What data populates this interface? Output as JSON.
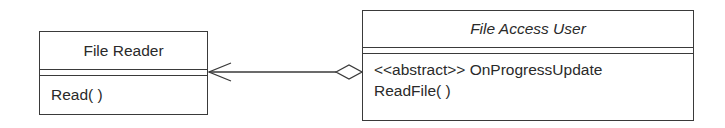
{
  "diagram_type": "UML class diagram",
  "classes": [
    {
      "id": "file-reader",
      "name": "File Reader",
      "abstract": false,
      "attributes": [],
      "operations": [
        "Read( )"
      ]
    },
    {
      "id": "file-access-user",
      "name": "File Access User",
      "abstract": true,
      "attributes": [],
      "operations": [
        "<<abstract>> OnProgressUpdate",
        "ReadFile( )"
      ]
    }
  ],
  "relationships": [
    {
      "type": "aggregation",
      "from": "file-access-user",
      "to": "file-reader",
      "navigable_end": "file-reader",
      "aggregate_end": "file-access-user"
    }
  ],
  "colors": {
    "line": "#3a3a3a",
    "text": "#2a2a2a",
    "background": "#ffffff"
  }
}
